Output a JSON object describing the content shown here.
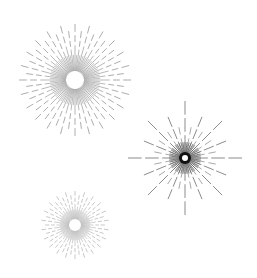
{
  "background": "#ffffff",
  "bursts": [
    {
      "name": "burst-large-top-left",
      "cx": 75,
      "cy": 80,
      "inner_radius": 8,
      "outer_radius": 56,
      "ray_count": 48,
      "color": "#8a8a8a",
      "style": "dashed-sunburst"
    },
    {
      "name": "burst-star-right",
      "cx": 185,
      "cy": 158,
      "inner_radius": 3,
      "outer_radius": 57,
      "ray_count": 16,
      "inner_ray_count": 48,
      "color": "#6e6e6e",
      "center_color": "#111111",
      "style": "starburst"
    },
    {
      "name": "burst-small-bottom-left",
      "cx": 75,
      "cy": 225,
      "inner_radius": 5,
      "outer_radius": 34,
      "ray_count": 44,
      "color": "#b0b0b0",
      "style": "dashed-sunburst"
    }
  ]
}
